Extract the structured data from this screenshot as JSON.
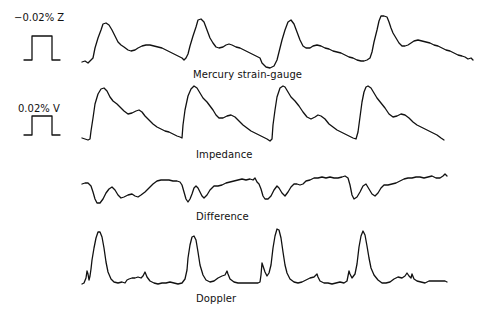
{
  "figure": {
    "calibrations": [
      {
        "id": "z",
        "label": "−0.02% Z"
      },
      {
        "id": "v",
        "label": "0.02% V"
      }
    ],
    "traces": [
      {
        "id": "mercury",
        "label": "Mercury strain-gauge"
      },
      {
        "id": "impedance",
        "label": "Impedance"
      },
      {
        "id": "difference",
        "label": "Difference"
      },
      {
        "id": "doppler",
        "label": "Doppler"
      }
    ],
    "caption_partial": "",
    "stroke_color": "#111111"
  }
}
